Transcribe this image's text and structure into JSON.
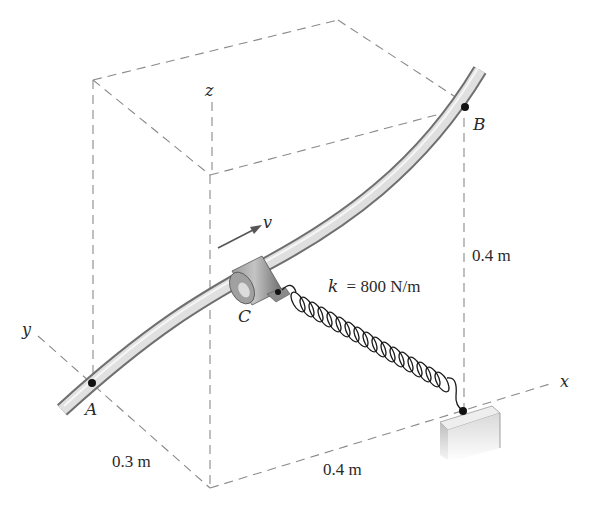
{
  "figure": {
    "points": {
      "A": "A",
      "B": "B",
      "C": "C"
    },
    "axes": {
      "x": "x",
      "y": "y",
      "z": "z"
    },
    "velocity_label": "v",
    "spring_label_k": "k",
    "spring_label_value": "= 800 N/m",
    "dimensions": {
      "y_offset": "0.3 m",
      "x_offset": "0.4 m",
      "z_height": "0.4 m"
    },
    "colors": {
      "dashed_lines": "#8a8a8a",
      "rod_light": "#e6e6e6",
      "rod_dark": "#7a7a7a",
      "collar": "#8c8c8c",
      "text": "#2a2a2a",
      "points": "#111111"
    }
  }
}
